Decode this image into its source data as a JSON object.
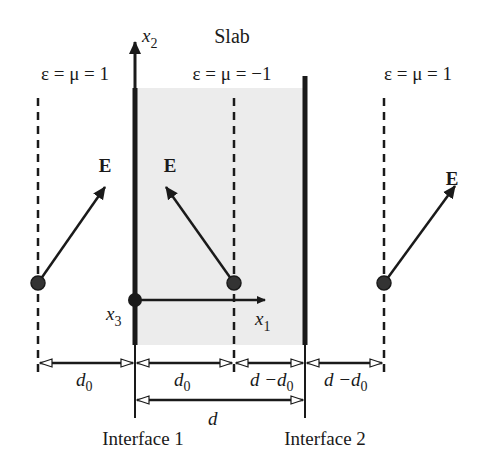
{
  "title": "Slab",
  "regions": {
    "left": {
      "label": "ε = μ = 1"
    },
    "slab": {
      "label": "ε = μ = −1"
    },
    "right": {
      "label": "ε = μ = 1"
    }
  },
  "axes": {
    "x1": {
      "base": "x",
      "sub": "1"
    },
    "x2": {
      "base": "x",
      "sub": "2"
    },
    "x3": {
      "base": "x",
      "sub": "3"
    }
  },
  "field_label": "E",
  "dimensions": {
    "d0_left": {
      "base": "d",
      "sub": "0"
    },
    "d0_slab": {
      "base": "d",
      "sub": "0"
    },
    "d_minus_d0_slab": {
      "prefix": "d −d",
      "sub": "0"
    },
    "d_minus_d0_right": {
      "prefix": "d −d",
      "sub": "0"
    },
    "d": "d"
  },
  "interfaces": {
    "interface1": "Interface 1",
    "interface2": "Interface 2"
  },
  "colors": {
    "ink": "#1a1a1a",
    "slab_fill": "#ececec",
    "background": "#ffffff"
  }
}
